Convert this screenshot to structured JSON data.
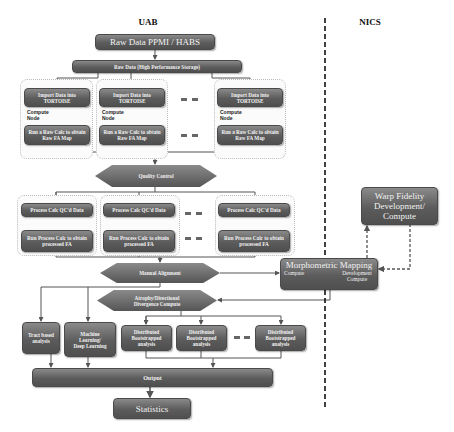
{
  "regions": {
    "left_label": "UAB",
    "right_label": "NICS"
  },
  "top": {
    "raw_source": "Raw Data PPMI / HABS",
    "raw_storage": "Raw Data (High Performance Storage)"
  },
  "import_stage": {
    "nodes": [
      {
        "top": "Import Data into TORTOISE",
        "node_label": "Compute Node",
        "bottom": "Run a Raw Calc to obtain Raw FA Map"
      },
      {
        "top": "Import Data into TORTOISE",
        "node_label": "Compute Node",
        "bottom": "Run a Raw Calc to obtain Raw FA Map"
      },
      {
        "top": "Import Data into TORTOISE",
        "node_label": "Compute Node",
        "bottom": "Run a Raw Calc to obtain Raw FA Map"
      }
    ],
    "ellipsis": "- -"
  },
  "quality_control": "Quality Control",
  "process_stage": {
    "nodes": [
      {
        "top": "Process Calc QC'd Data",
        "bottom": "Run Process Calc to obtain processed FA"
      },
      {
        "top": "Process Calc QC'd Data",
        "bottom": "Run Process Calc to obtain processed FA"
      },
      {
        "top": "Process Calc QC'd Data",
        "bottom": "Run Process Calc to obtain processed FA"
      }
    ],
    "ellipsis": "- -"
  },
  "manual_alignment": "Manual Alignment",
  "atrophy": "Atrophy/Directional Divergence Compute",
  "morphometric": {
    "title": "Morphometric Mapping",
    "left": "Compute",
    "right": "Development Compute"
  },
  "warp_fidelity": "Warp Fidelity Development/ Compute",
  "analysis": {
    "tract": "Tract based analysis",
    "ml": "Machine Learning/ Deep Learning",
    "distributed": [
      "Distributed Bootstrapped analysis",
      "Distributed Bootstrapped analysis",
      "Distributed Bootstrapped analysis"
    ],
    "ellipsis": "- -"
  },
  "output": "Output",
  "statistics": "Statistics"
}
